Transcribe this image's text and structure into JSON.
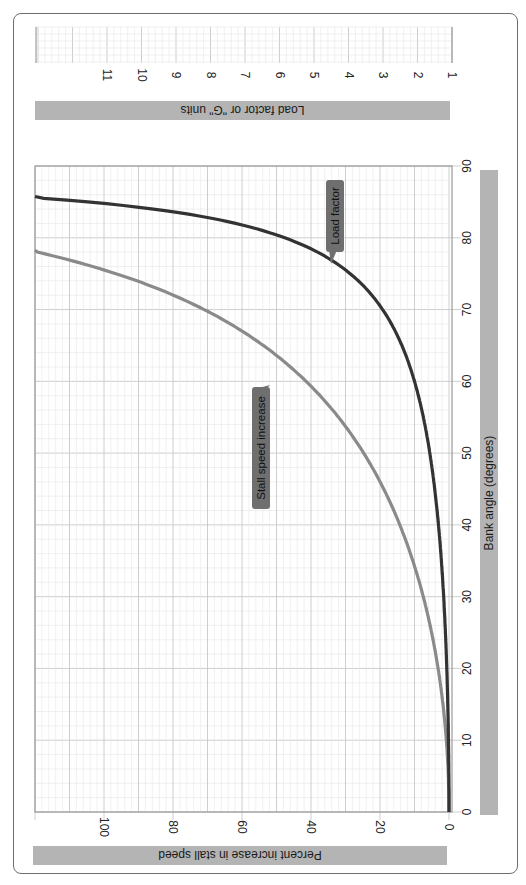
{
  "chart_data": {
    "type": "line",
    "orientation": "rotated-90-clockwise",
    "title": "",
    "xlabel": "Bank angle (degrees)",
    "ylabel": "Percent increase in stall speed",
    "y2label": "Load factor or \"G\" units",
    "x_ticks": [
      0,
      10,
      20,
      30,
      40,
      50,
      60,
      70,
      80,
      90
    ],
    "y_ticks": [
      0,
      20,
      40,
      60,
      80,
      100
    ],
    "y2_ticks": [
      1,
      2,
      3,
      4,
      5,
      6,
      7,
      8,
      9,
      10,
      11
    ],
    "xlim": [
      0,
      90
    ],
    "ylim": [
      0,
      120
    ],
    "y2lim": [
      1,
      13
    ],
    "grid": true,
    "x": [
      0,
      10,
      20,
      30,
      40,
      50,
      60,
      70,
      75,
      78,
      80,
      85,
      86
    ],
    "series": [
      {
        "name": "Stall speed increase",
        "axis": "left",
        "color": "#8a8a8a",
        "values": [
          0,
          0.8,
          3.2,
          7.5,
          14.3,
          24.7,
          41.4,
          71.0,
          96.6,
          119.3,
          140.0,
          238.7,
          283.0
        ]
      },
      {
        "name": "Load factor",
        "axis": "right",
        "color": "#333333",
        "values": [
          1.0,
          1.02,
          1.06,
          1.15,
          1.31,
          1.56,
          2.0,
          2.92,
          3.86,
          4.81,
          5.76,
          11.47,
          14.34
        ]
      }
    ],
    "annotations": [
      {
        "text": "Load factor",
        "target_series": "Load factor",
        "at_x": 76
      },
      {
        "text": "Stall speed increase",
        "target_series": "Stall speed increase",
        "at_x": 63
      }
    ]
  },
  "labels": {
    "load_axis": "Load factor or \"G\" units",
    "stall_axis": "Percent increase in stall speed",
    "bank_axis": "Bank angle (degrees)",
    "load_callout": "Load factor",
    "stall_callout": "Stall speed increase"
  },
  "colors": {
    "label_bar": "#b4b4b4",
    "callout": "#6f6f6f",
    "stall_curve": "#8a8a8a",
    "load_curve": "#333333",
    "grid_major": "#c8c8c8",
    "grid_minor": "#e6e6e6",
    "frame": "#9a9a9a"
  }
}
